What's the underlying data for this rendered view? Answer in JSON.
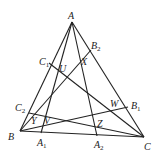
{
  "diagram": {
    "type": "geometry",
    "points": {
      "A": {
        "label": "A",
        "x": 72,
        "y": 22
      },
      "B": {
        "label": "B",
        "x": 20,
        "y": 131
      },
      "C": {
        "label": "C",
        "x": 144,
        "y": 137
      },
      "A1": {
        "label": "A",
        "sub": "1",
        "x": 41,
        "y": 133
      },
      "A2": {
        "label": "A",
        "sub": "2",
        "x": 97,
        "y": 136
      },
      "B1": {
        "label": "B",
        "sub": "1",
        "x": 128,
        "y": 107
      },
      "B2": {
        "label": "B",
        "sub": "2",
        "x": 91,
        "y": 50
      },
      "C1": {
        "label": "C",
        "sub": "1",
        "x": 49,
        "y": 63
      },
      "C2": {
        "label": "C",
        "sub": "2",
        "x": 29,
        "y": 113
      }
    },
    "intersection_labels": [
      "U",
      "X",
      "W",
      "Z",
      "Y",
      "V"
    ],
    "segments": [
      [
        "A",
        "B"
      ],
      [
        "B",
        "C"
      ],
      [
        "C",
        "A"
      ],
      [
        "A",
        "A1"
      ],
      [
        "A",
        "A2"
      ],
      [
        "B",
        "B1"
      ],
      [
        "B",
        "B2"
      ],
      [
        "C",
        "C1"
      ],
      [
        "C",
        "C2"
      ]
    ]
  }
}
